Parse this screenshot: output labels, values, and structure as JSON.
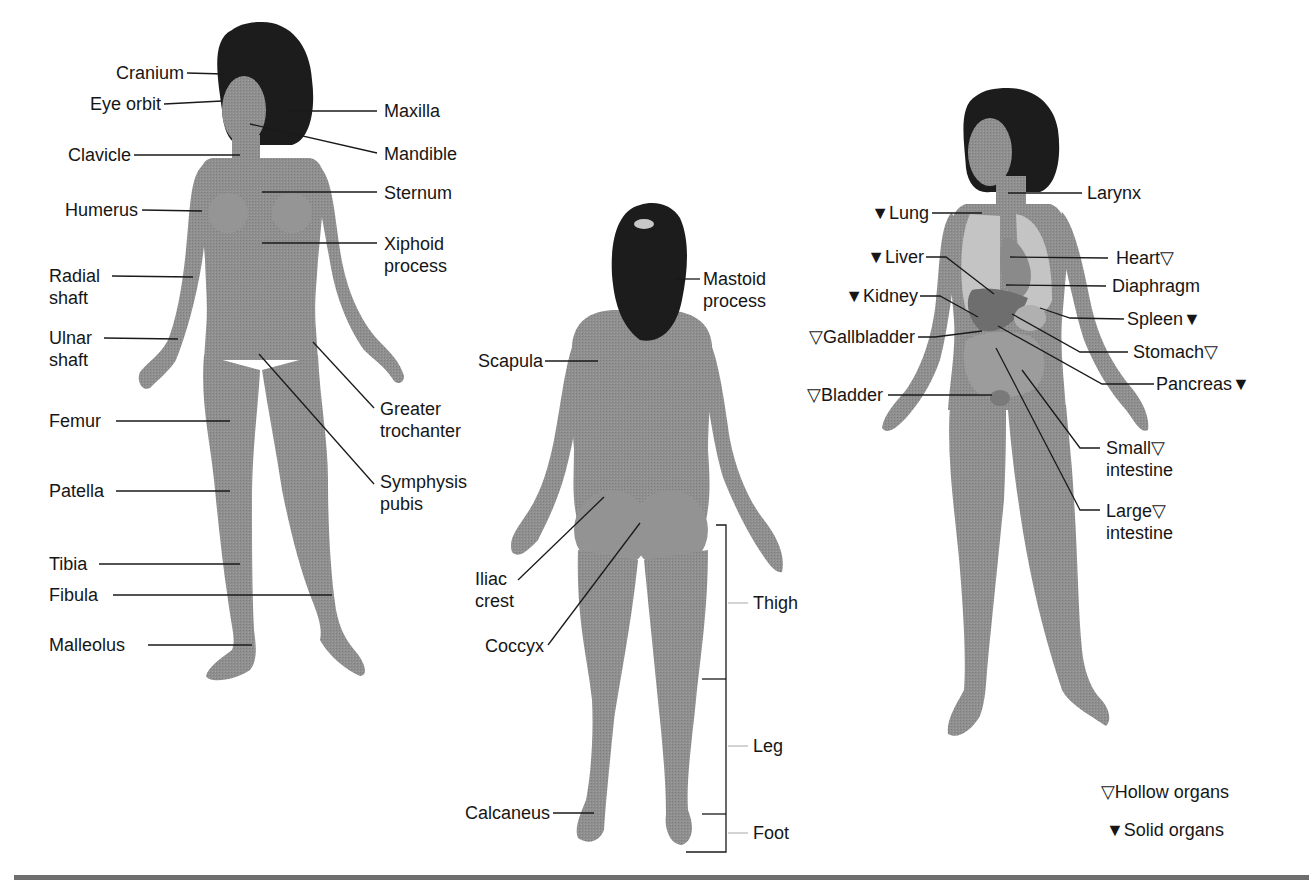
{
  "figure": {
    "colors": {
      "skin": "#8f8f8f",
      "skin_dark": "#7a7a7a",
      "hair": "#1c1c1c",
      "organ_light": "#c4c4c4",
      "organ_mid": "#9a9a9a",
      "organ_dark": "#6e6e6e",
      "line": "#1a1a1a",
      "rule": "#6e6e6e"
    },
    "anterior_skeletal": {
      "left_labels": {
        "cranium": "Cranium",
        "eye_orbit": "Eye orbit",
        "clavicle": "Clavicle",
        "humerus": "Humerus",
        "radial_shaft_1": "Radial",
        "radial_shaft_2": "shaft",
        "ulnar_shaft_1": "Ulnar",
        "ulnar_shaft_2": "shaft",
        "femur": "Femur",
        "patella": "Patella",
        "tibia": "Tibia",
        "fibula": "Fibula",
        "malleolus": "Malleolus"
      },
      "right_labels": {
        "maxilla": "Maxilla",
        "mandible": "Mandible",
        "sternum": "Sternum",
        "xiphoid_1": "Xiphoid",
        "xiphoid_2": "process",
        "greater_trochanter_1": "Greater",
        "greater_trochanter_2": "trochanter",
        "symphysis_pubis_1": "Symphysis",
        "symphysis_pubis_2": "pubis"
      }
    },
    "posterior": {
      "labels": {
        "mastoid_1": "Mastoid",
        "mastoid_2": "process",
        "scapula": "Scapula",
        "iliac_crest_1": "Iliac",
        "iliac_crest_2": "crest",
        "coccyx": "Coccyx",
        "calcaneus": "Calcaneus",
        "thigh": "Thigh",
        "leg": "Leg",
        "foot": "Foot"
      }
    },
    "organs": {
      "labels": {
        "larynx": "Larynx",
        "lung": "▼Lung",
        "liver": "▼Liver",
        "kidney": "▼Kidney",
        "gallbladder": "▽Gallbladder",
        "bladder": "▽Bladder",
        "heart": "Heart▽",
        "diaphragm": "Diaphragm",
        "spleen": "Spleen▼",
        "stomach": "Stomach▽",
        "pancreas": "Pancreas▼",
        "small_intestine_1": "Small▽",
        "small_intestine_2": "intestine",
        "large_intestine_1": "Large▽",
        "large_intestine_2": "intestine"
      }
    },
    "legend": {
      "hollow": "▽Hollow organs",
      "solid": "▼Solid organs"
    }
  }
}
